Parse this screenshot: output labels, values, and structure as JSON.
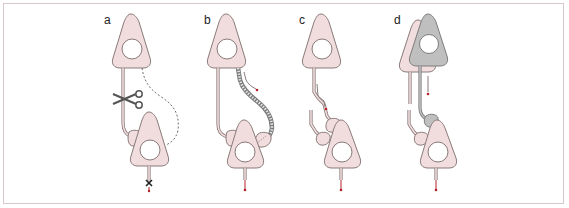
{
  "figure": {
    "colors": {
      "cell_fill": "#f1dddd",
      "cell_outline": "#8a7a7a",
      "gray_cell_fill": "#bfbfbf",
      "gray_cell_outline": "#7d7d7d",
      "signal_arrow": "#b3222a",
      "nucleus": "#ffffff",
      "frame_border": "#d8c8c8"
    },
    "panels": [
      {
        "label": "a",
        "content": "axon cut with scissors; dotted regrowth path; blocked output (x)"
      },
      {
        "label": "b",
        "content": "regrowing axon (beaded) with red arrow toward target synapse"
      },
      {
        "label": "c",
        "content": "severed axon segments with red arrow; bottom neuron output arrow"
      },
      {
        "label": "d",
        "content": "gray overlapping neuron forms new connection; red arrows"
      }
    ]
  }
}
